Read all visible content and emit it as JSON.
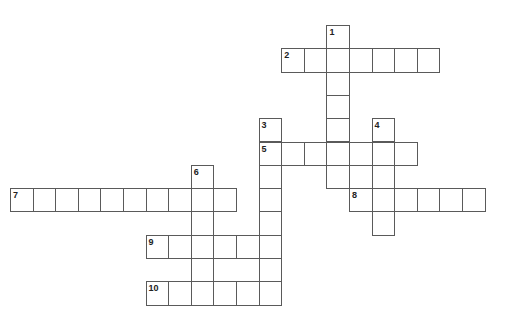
{
  "puzzle": {
    "grid": {
      "origin_x": 10,
      "origin_y": 25,
      "cell_w": 22.6,
      "cell_h": 23.3,
      "border_color": "#5a5a5a"
    },
    "entries": [
      {
        "number": "1",
        "direction": "down",
        "row": 0,
        "col": 14,
        "length": 7
      },
      {
        "number": "2",
        "direction": "across",
        "row": 1,
        "col": 12,
        "length": 7
      },
      {
        "number": "3",
        "direction": "down",
        "row": 4,
        "col": 11,
        "length": 8
      },
      {
        "number": "4",
        "direction": "down",
        "row": 4,
        "col": 16,
        "length": 5
      },
      {
        "number": "5",
        "direction": "across",
        "row": 5,
        "col": 11,
        "length": 7
      },
      {
        "number": "6",
        "direction": "down",
        "row": 6,
        "col": 8,
        "length": 6
      },
      {
        "number": "7",
        "direction": "across",
        "row": 7,
        "col": 0,
        "length": 10
      },
      {
        "number": "8",
        "direction": "across",
        "row": 7,
        "col": 15,
        "length": 6
      },
      {
        "number": "9",
        "direction": "across",
        "row": 9,
        "col": 6,
        "length": 6
      },
      {
        "number": "10",
        "direction": "across",
        "row": 11,
        "col": 6,
        "length": 6
      }
    ]
  }
}
